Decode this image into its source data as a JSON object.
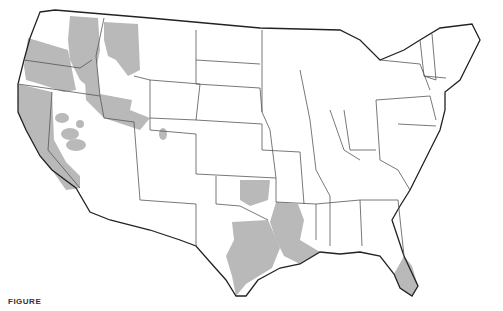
{
  "map": {
    "title": "United States map with shaded regions",
    "colors": {
      "background": "#ffffff",
      "land": "#ffffff",
      "shaded": "#b9b9b9",
      "border": "#222222",
      "state_border": "#555555"
    },
    "shaded_regions": [
      "Pacific Northwest (Washington, Oregon, Idaho, western Montana)",
      "California",
      "Nevada (scattered patches)",
      "Utah / Wyoming border area",
      "Oklahoma",
      "Arkansas / Louisiana",
      "Southeast Texas",
      "South Florida"
    ]
  },
  "caption": {
    "label": "FIGURE",
    "text": ""
  }
}
